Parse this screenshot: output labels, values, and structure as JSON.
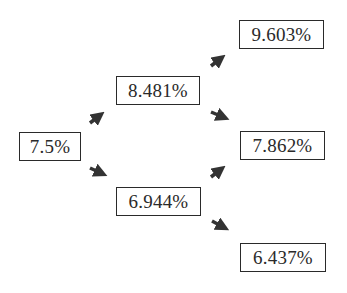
{
  "tree": {
    "type": "binomial-interest-rate-tree",
    "root": {
      "label": "7.5%"
    },
    "step1": {
      "up": {
        "label": "8.481%"
      },
      "down": {
        "label": "6.944%"
      }
    },
    "step2": {
      "uu": {
        "label": "9.603%"
      },
      "ud": {
        "label": "7.862%"
      },
      "dd": {
        "label": "6.437%"
      }
    }
  },
  "colors": {
    "box_border": "#2a2a2a",
    "text": "#2a2a2a",
    "arrow": "#333333",
    "background": "#ffffff"
  }
}
